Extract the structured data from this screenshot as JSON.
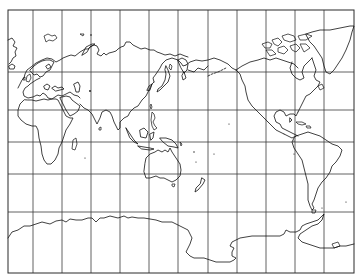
{
  "map": {
    "type": "world-coastline-map",
    "projection": "cylindrical (Miller-style), Pacific-centered",
    "center_longitude": 150,
    "background_color": "#ffffff",
    "line_color": "#111111",
    "grid_color": "#3a3a3a",
    "frame": {
      "x": 8,
      "y": 10,
      "width": 346,
      "height": 263
    },
    "grid": {
      "meridian_spacing_deg": 30,
      "vertical_lines_px": [
        33,
        62,
        91,
        120,
        149,
        178,
        208,
        237,
        266,
        295,
        324
      ],
      "horizontal_lines_px": [
        72,
        110,
        142,
        174,
        212
      ],
      "columns": 12,
      "rows": 6
    },
    "landmasses": [
      "Greenland (west edge)",
      "Iceland",
      "Europe",
      "Africa",
      "Madagascar",
      "Asia",
      "Japan",
      "Indonesia",
      "Philippines",
      "Australia",
      "Tasmania",
      "New Zealand",
      "North America",
      "Canadian Arctic Archipelago",
      "Greenland (east)",
      "Central America",
      "Caribbean",
      "South America",
      "Antarctica"
    ]
  }
}
